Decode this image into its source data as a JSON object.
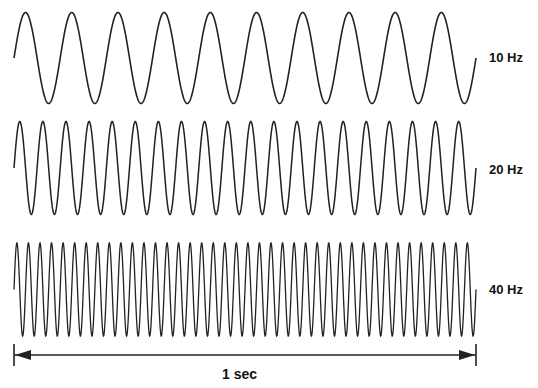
{
  "waves": [
    {
      "label": "10 Hz",
      "frequency": 10,
      "center_y": 58,
      "amplitude": 45.5,
      "label_x": 489,
      "label_y": 50
    },
    {
      "label": "20 Hz",
      "frequency": 20,
      "center_y": 168,
      "amplitude": 46.5,
      "label_x": 489,
      "label_y": 162
    },
    {
      "label": "40 Hz",
      "frequency": 40,
      "center_y": 289.5,
      "amplitude": 46.5,
      "label_x": 489,
      "label_y": 282
    }
  ],
  "time_axis": {
    "label": "1 sec",
    "x_start": 14,
    "x_end": 476,
    "y": 355
  },
  "colors": {
    "stroke": "#222222",
    "background": "#ffffff"
  }
}
